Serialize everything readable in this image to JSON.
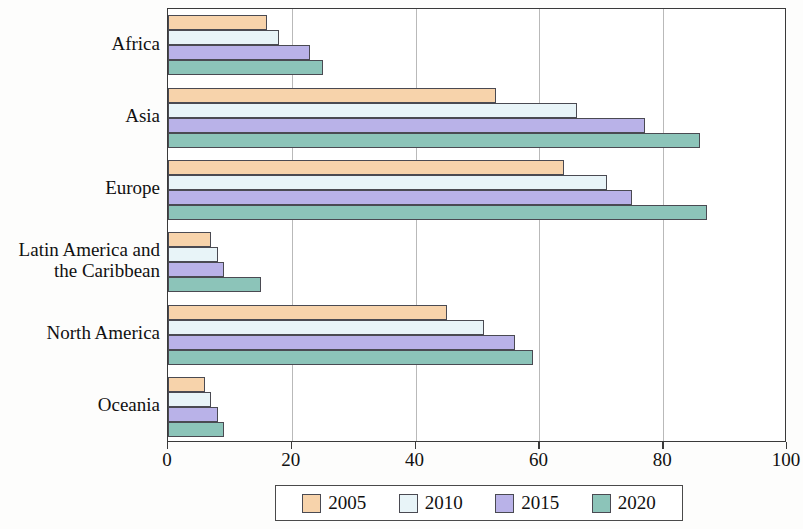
{
  "chart_data": {
    "type": "bar",
    "orientation": "horizontal",
    "title": "",
    "xlabel": "",
    "ylabel": "",
    "xlim": [
      0,
      100
    ],
    "xticks": [
      0,
      20,
      40,
      60,
      80,
      100
    ],
    "grid": "vertical",
    "legend_position": "bottom",
    "categories": [
      "Africa",
      "Asia",
      "Europe",
      "Latin America and the Caribbean",
      "North America",
      "Oceania"
    ],
    "category_label_lines": [
      [
        "Africa"
      ],
      [
        "Asia"
      ],
      [
        "Europe"
      ],
      [
        "Latin America and",
        "the Caribbean"
      ],
      [
        "North America"
      ],
      [
        "Oceania"
      ]
    ],
    "series": [
      {
        "name": "2005",
        "color": "#f7d3ab",
        "values": [
          16,
          53,
          64,
          7,
          45,
          6
        ]
      },
      {
        "name": "2010",
        "color": "#e8f4f8",
        "values": [
          18,
          66,
          71,
          8,
          51,
          7
        ]
      },
      {
        "name": "2015",
        "color": "#b9b2e8",
        "values": [
          23,
          77,
          75,
          9,
          56,
          8
        ]
      },
      {
        "name": "2020",
        "color": "#8cc4b9",
        "values": [
          25,
          86,
          87,
          15,
          59,
          9
        ]
      }
    ]
  },
  "axis": {
    "x_tick_labels": [
      "0",
      "20",
      "40",
      "60",
      "80",
      "100"
    ]
  },
  "legend": {
    "entries": [
      {
        "label": "2005",
        "color": "#f7d3ab"
      },
      {
        "label": "2010",
        "color": "#e8f4f8"
      },
      {
        "label": "2015",
        "color": "#b9b2e8"
      },
      {
        "label": "2020",
        "color": "#8cc4b9"
      }
    ]
  },
  "colors": {
    "axis": "#3a3a3a",
    "grid": "#b9b9b9",
    "bar_border": "#4a4a52",
    "background": "#ffffff"
  }
}
